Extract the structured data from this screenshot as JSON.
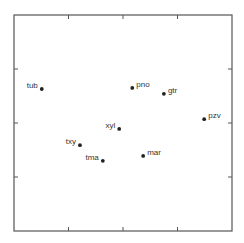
{
  "chart_data": {
    "type": "scatter",
    "title": "",
    "xlabel": "",
    "ylabel": "",
    "xlim": [
      0,
      4
    ],
    "ylim": [
      0,
      4
    ],
    "xticks": [
      1,
      2,
      3
    ],
    "yticks": [
      1,
      2,
      3
    ],
    "tick_labels_shown": false,
    "grid": false,
    "legend": "none",
    "point_color": "#222222",
    "points": [
      {
        "label": "tub",
        "x": 0.51,
        "y": 2.63,
        "label_side": "left"
      },
      {
        "label": "pno",
        "x": 2.17,
        "y": 2.65,
        "label_side": "right"
      },
      {
        "label": "gtr",
        "x": 2.75,
        "y": 2.54,
        "label_side": "right"
      },
      {
        "label": "pzv",
        "x": 3.49,
        "y": 2.07,
        "label_side": "right"
      },
      {
        "label": "xyl",
        "x": 1.93,
        "y": 1.89,
        "label_side": "left"
      },
      {
        "label": "txy",
        "x": 1.21,
        "y": 1.59,
        "label_side": "left"
      },
      {
        "label": "tma",
        "x": 1.63,
        "y": 1.3,
        "label_side": "left"
      },
      {
        "label": "mar",
        "x": 2.37,
        "y": 1.39,
        "label_side": "right"
      }
    ]
  }
}
